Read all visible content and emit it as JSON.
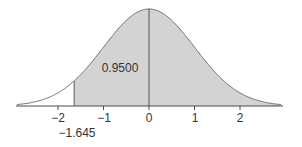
{
  "chart_data": {
    "type": "area",
    "title": "",
    "xlabel": "",
    "ylabel": "",
    "distribution": "standard normal",
    "xlim": [
      -2.9,
      2.9
    ],
    "x_ticks": [
      -2,
      -1,
      0,
      1,
      2
    ],
    "x_tick_labels": [
      "−2",
      "−1",
      "0",
      "1",
      "2"
    ],
    "shaded_region": {
      "from": -1.645,
      "to": 2.9,
      "area": 0.95
    },
    "annotations": [
      {
        "text": "0.9500",
        "role": "shaded-area-label"
      },
      {
        "text": "−1.645",
        "role": "critical-value-label",
        "x": -1.645
      }
    ],
    "grid": false,
    "legend": null
  },
  "labels": {
    "area": "0.9500",
    "critical": "−1.645",
    "ticks": [
      "−2",
      "−1",
      "0",
      "1",
      "2"
    ]
  },
  "colors": {
    "fill": "#d3d3d3",
    "curve": "#6e6e6e",
    "axis": "#4a4a4a",
    "text": "#333333"
  }
}
